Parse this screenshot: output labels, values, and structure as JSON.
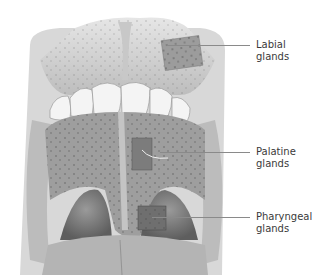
{
  "figure": {
    "labels": [
      {
        "id": "labial",
        "line1": "Labial",
        "line2": "glands"
      },
      {
        "id": "palatine",
        "line1": "Palatine",
        "line2": "glands"
      },
      {
        "id": "pharyngeal",
        "line1": "Pharyngeal",
        "line2": "glands"
      }
    ]
  }
}
